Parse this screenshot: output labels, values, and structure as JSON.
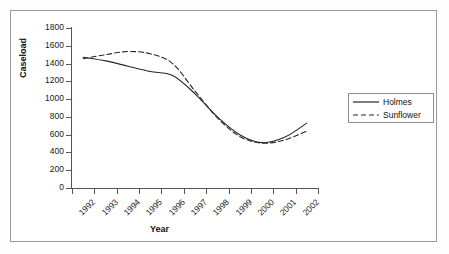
{
  "chart_data": {
    "type": "line",
    "title": "",
    "xlabel": "Year",
    "ylabel": "Caseload",
    "categories": [
      "1992",
      "1993",
      "1994",
      "1995",
      "1996",
      "1997",
      "1998",
      "1999",
      "2000",
      "2001",
      "2002"
    ],
    "ylim": [
      0,
      1800
    ],
    "yticks": [
      0,
      200,
      400,
      600,
      800,
      1000,
      1200,
      1400,
      1600,
      1800
    ],
    "ytick_labels": [
      "0",
      "200",
      "400",
      "600",
      "800",
      "1000",
      "1200",
      "1400",
      "1600",
      "1800"
    ],
    "grid": false,
    "legend_position": "right",
    "series": [
      {
        "name": "Holmes",
        "style": "solid",
        "color": "#262626",
        "values": [
          1470,
          1430,
          1370,
          1310,
          1265,
          1060,
          800,
          600,
          510,
          570,
          730
        ]
      },
      {
        "name": "Sunflower",
        "style": "dashed",
        "color": "#262626",
        "values": [
          1455,
          1500,
          1535,
          1510,
          1400,
          1090,
          790,
          580,
          505,
          540,
          640
        ]
      }
    ]
  },
  "legend": {
    "items": [
      {
        "label": "Holmes",
        "style": "solid"
      },
      {
        "label": "Sunflower",
        "style": "dashed"
      }
    ]
  },
  "colors": {
    "frame": "#9a9a9a",
    "axis": "#555555",
    "text": "#1a1a1a",
    "line": "#262626",
    "background": "#ffffff"
  }
}
